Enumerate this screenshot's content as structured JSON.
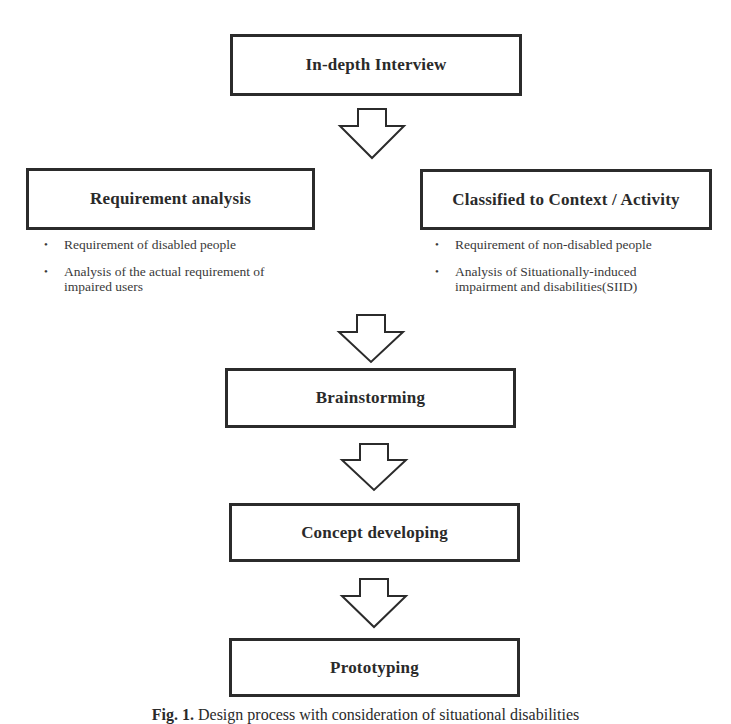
{
  "diagram": {
    "type": "flowchart",
    "nodes": {
      "interview": {
        "label": "In-depth Interview"
      },
      "requirement": {
        "label": "Requirement analysis",
        "bullets": [
          "Requirement of disabled people",
          "Analysis of the actual requirement of impaired users"
        ]
      },
      "classified": {
        "label": "Classified to Context / Activity",
        "bullets": [
          "Requirement of non-disabled people",
          "Analysis of Situationally-induced impairment and disabilities(SIID)"
        ]
      },
      "brainstorming": {
        "label": "Brainstorming"
      },
      "concept": {
        "label": "Concept developing"
      },
      "prototyping": {
        "label": "Prototyping"
      }
    },
    "edges": [
      {
        "from": "interview",
        "to": [
          "requirement",
          "classified"
        ]
      },
      {
        "from": [
          "requirement",
          "classified"
        ],
        "to": "brainstorming"
      },
      {
        "from": "brainstorming",
        "to": "concept"
      },
      {
        "from": "concept",
        "to": "prototyping"
      }
    ],
    "bullet_glyph": "•",
    "arrow_icon": "hollow-down-arrow",
    "colors": {
      "stroke": "#2b2b2b",
      "text": "#2a2a2a",
      "background": "#ffffff"
    }
  },
  "caption": {
    "prefix": "Fig. 1.",
    "text": " Design process with consideration of situational disabilities"
  }
}
